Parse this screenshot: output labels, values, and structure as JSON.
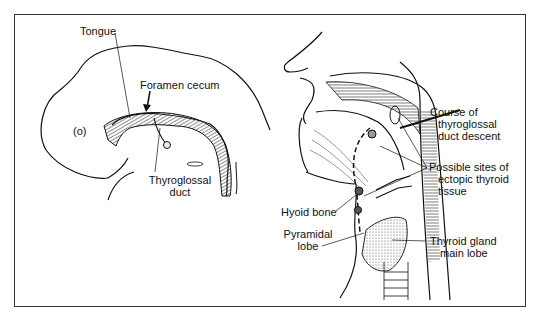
{
  "figure": {
    "left_panel": {
      "title": "Embryo sagittal view",
      "labels": {
        "tongue": "Tongue",
        "foramen_cecum": "Foramen cecum",
        "thyroglossal_duct_l1": "Thyroglossal",
        "thyroglossal_duct_l2": "duct",
        "mouth_marker": "(o)"
      }
    },
    "right_panel": {
      "title": "Adult head and neck sagittal view",
      "labels": {
        "course_l1": "Course of",
        "course_l2": "thyroglossal",
        "course_l3": "duct descent",
        "ectopic_l1": "Possible sites of",
        "ectopic_l2": "ectopic thyroid",
        "ectopic_l3": "tissue",
        "hyoid": "Hyoid bone",
        "pyramidal_l1": "Pyramidal",
        "pyramidal_l2": "lobe",
        "thyroid_l1": "Thyroid gland",
        "thyroid_l2": "main lobe"
      }
    },
    "colors": {
      "ink": "#111111",
      "frame": "#333333",
      "background": "#ffffff",
      "stipple": "#cfcfcf"
    }
  }
}
